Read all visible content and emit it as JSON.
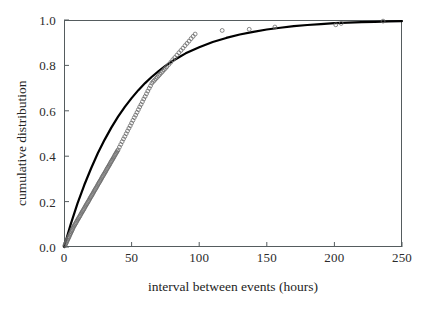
{
  "figure": {
    "background_color": "#ffffff",
    "frame_color": "#555c5e",
    "curve_color": "#000000",
    "marker_color": "#6b6b6b"
  },
  "caption": {
    "partial_text": ""
  },
  "chart_data": {
    "type": "scatter",
    "title": "",
    "subtitle": "",
    "xlabel": "interval between events (hours)",
    "ylabel": "cumulative distribution",
    "xlim": [
      0,
      250
    ],
    "ylim": [
      0.0,
      1.0
    ],
    "xticks": [
      0,
      50,
      100,
      150,
      200,
      250
    ],
    "xtick_labels": [
      "0",
      "50",
      "100",
      "150",
      "200",
      "250"
    ],
    "yticks": [
      0.0,
      0.2,
      0.4,
      0.6,
      0.8,
      1.0
    ],
    "ytick_labels": [
      "0.0",
      "0.2",
      "0.4",
      "0.6",
      "0.8",
      "1.0"
    ],
    "grid": false,
    "legend": false,
    "legend_position": "none",
    "tick_direction": "in",
    "series": [
      {
        "name": "empirical cumulative distribution",
        "type": "scatter",
        "marker": "open-circle",
        "marker_size": 3,
        "x": [
          0.5,
          1.0,
          1.4,
          1.8,
          2.2,
          2.6,
          3.0,
          3.4,
          3.8,
          4.2,
          4.6,
          5.0,
          5.4,
          5.8,
          6.2,
          6.6,
          7.0,
          7.5,
          8.0,
          8.5,
          9.0,
          9.5,
          10.0,
          10.5,
          11.0,
          11.5,
          12.0,
          12.5,
          13.0,
          13.5,
          14.0,
          14.5,
          15.0,
          15.5,
          16.0,
          16.5,
          17.0,
          17.5,
          18.0,
          18.5,
          19.0,
          19.5,
          20.0,
          20.5,
          21.0,
          21.5,
          22.0,
          22.5,
          23.0,
          23.5,
          24.0,
          24.5,
          25.0,
          25.5,
          26.0,
          26.5,
          27.0,
          27.5,
          28.0,
          28.5,
          29.0,
          29.5,
          30.0,
          30.5,
          31.0,
          31.5,
          32.0,
          32.5,
          33.0,
          33.5,
          34.0,
          34.5,
          35.0,
          35.5,
          36.0,
          36.5,
          37.0,
          37.5,
          38.0,
          38.5,
          39.0,
          39.5,
          40.0,
          41.0,
          42.0,
          43.0,
          44.0,
          45.0,
          46.0,
          47.0,
          48.0,
          49.0,
          50.0,
          51.0,
          52.0,
          53.0,
          54.0,
          55.0,
          56.0,
          57.0,
          58.0,
          59.0,
          60.0,
          61.0,
          62.0,
          63.0,
          64.0,
          65.0,
          66.0,
          67.0,
          68.0,
          69.0,
          70.0,
          71.0,
          72.0,
          73.0,
          74.0,
          75.0,
          76.0,
          77.5,
          79.0,
          80.5,
          82.0,
          83.5,
          85.0,
          86.5,
          88.0,
          89.5,
          91.0,
          92.5,
          94.0,
          95.5,
          97.0,
          117.0,
          137.0,
          156.0,
          201.0,
          205.0,
          236.0
        ],
        "y": [
          0.005,
          0.01,
          0.015,
          0.02,
          0.026,
          0.031,
          0.036,
          0.041,
          0.046,
          0.052,
          0.057,
          0.062,
          0.067,
          0.072,
          0.077,
          0.083,
          0.088,
          0.093,
          0.098,
          0.103,
          0.108,
          0.114,
          0.119,
          0.124,
          0.129,
          0.134,
          0.139,
          0.145,
          0.15,
          0.155,
          0.16,
          0.165,
          0.17,
          0.176,
          0.181,
          0.186,
          0.191,
          0.196,
          0.201,
          0.206,
          0.212,
          0.217,
          0.222,
          0.227,
          0.232,
          0.237,
          0.243,
          0.248,
          0.253,
          0.258,
          0.263,
          0.268,
          0.274,
          0.279,
          0.284,
          0.289,
          0.294,
          0.299,
          0.305,
          0.31,
          0.315,
          0.32,
          0.325,
          0.33,
          0.335,
          0.341,
          0.346,
          0.351,
          0.356,
          0.361,
          0.366,
          0.372,
          0.377,
          0.382,
          0.387,
          0.392,
          0.397,
          0.403,
          0.408,
          0.413,
          0.418,
          0.423,
          0.428,
          0.44,
          0.452,
          0.464,
          0.476,
          0.487,
          0.499,
          0.511,
          0.523,
          0.534,
          0.546,
          0.558,
          0.57,
          0.581,
          0.593,
          0.605,
          0.617,
          0.628,
          0.64,
          0.652,
          0.663,
          0.675,
          0.687,
          0.699,
          0.71,
          0.722,
          0.729,
          0.735,
          0.742,
          0.748,
          0.755,
          0.761,
          0.768,
          0.774,
          0.781,
          0.787,
          0.794,
          0.804,
          0.814,
          0.825,
          0.835,
          0.845,
          0.856,
          0.866,
          0.876,
          0.887,
          0.897,
          0.907,
          0.918,
          0.928,
          0.938,
          0.954,
          0.959,
          0.969,
          0.979,
          0.985,
          0.995
        ]
      },
      {
        "name": "fitted exponential curve",
        "type": "line",
        "line_width": 2.2,
        "model": "1 - exp(-x/47)",
        "x": [
          0,
          5,
          10,
          15,
          20,
          25,
          30,
          35,
          40,
          45,
          50,
          55,
          60,
          65,
          70,
          75,
          80,
          85,
          90,
          95,
          100,
          110,
          120,
          130,
          140,
          150,
          160,
          170,
          180,
          190,
          200,
          210,
          220,
          230,
          240,
          250
        ],
        "y": [
          0.0,
          0.101,
          0.192,
          0.273,
          0.346,
          0.413,
          0.472,
          0.526,
          0.574,
          0.617,
          0.656,
          0.691,
          0.722,
          0.75,
          0.775,
          0.798,
          0.818,
          0.836,
          0.853,
          0.867,
          0.88,
          0.903,
          0.921,
          0.936,
          0.948,
          0.958,
          0.966,
          0.973,
          0.978,
          0.982,
          0.986,
          0.988,
          0.991,
          0.992,
          0.994,
          0.995
        ]
      }
    ]
  }
}
